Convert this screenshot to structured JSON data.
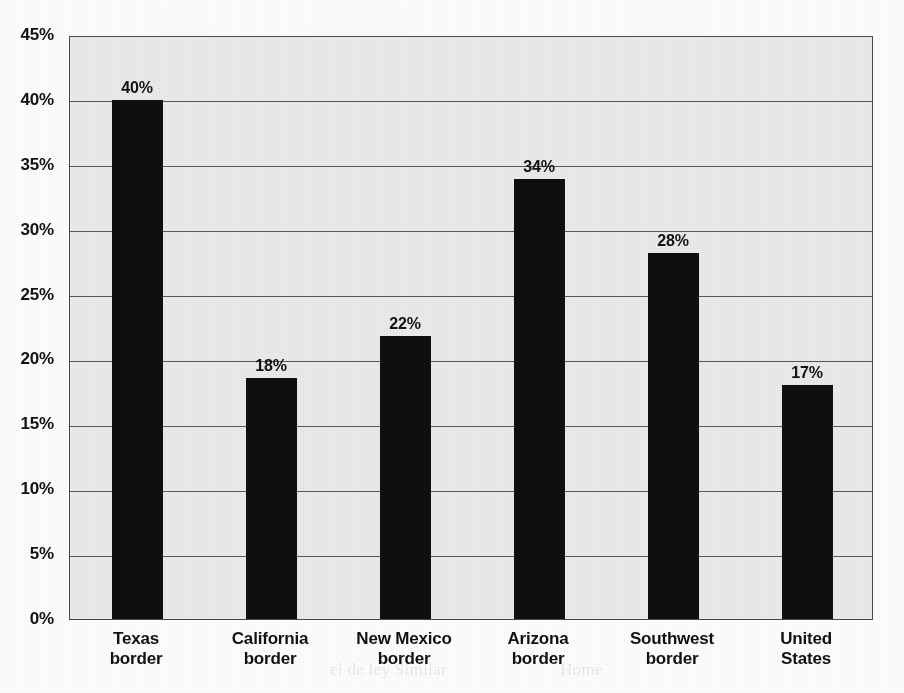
{
  "chart_data": {
    "type": "bar",
    "title": "",
    "subtitle": "",
    "xlabel": "",
    "ylabel": "",
    "categories": [
      "Texas border",
      "California border",
      "New Mexico border",
      "Arizona border",
      "Southwest border",
      "United States"
    ],
    "category_lines": [
      [
        "Texas",
        "border"
      ],
      [
        "California",
        "border"
      ],
      [
        "New Mexico",
        "border"
      ],
      [
        "Arizona",
        "border"
      ],
      [
        "Southwest",
        "border"
      ],
      [
        "United",
        "States"
      ]
    ],
    "values": [
      40,
      18,
      22,
      34,
      28,
      17
    ],
    "plotted_values": [
      40,
      18.6,
      21.8,
      33.9,
      28.2,
      18.0
    ],
    "data_labels": [
      "40%",
      "18%",
      "22%",
      "34%",
      "28%",
      "17%"
    ],
    "ylim": [
      0,
      45
    ],
    "ytick_values": [
      0,
      5,
      10,
      15,
      20,
      25,
      30,
      35,
      40,
      45
    ],
    "ytick_labels": [
      "0%",
      "5%",
      "10%",
      "15%",
      "20%",
      "25%",
      "30%",
      "35%",
      "40%",
      "45%"
    ],
    "grid": true,
    "grid_axis": "y",
    "legend": false,
    "legend_position": "none",
    "bar_color": "#100f0f",
    "plot_background": "#eceaea",
    "axis_color": "#4a4a4a",
    "gridline_color": "#585858"
  },
  "scan": {
    "ghost_text": [
      "Tij years",
      "Sierra",
      "Texas border",
      "1.4",
      "Salton   major border point",
      "sons in Cross-border",
      "ality needs, Arizona border communities with a low-density",
      "in the u.s.-scoped environment, the conclusion of the border",
      "rights ofter bad indicators, sometimes shifting toward higher rates",
      "our health cross-border of life, in the impact of health care",
      "of the border health",
      "el de ley        Similar",
      "Home"
    ]
  }
}
